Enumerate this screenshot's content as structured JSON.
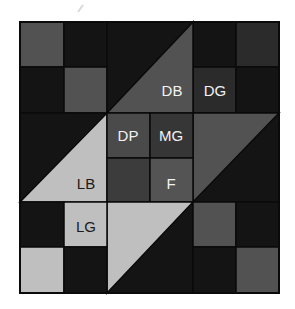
{
  "diagram": {
    "type": "quilt-block",
    "grid": {
      "columns": 6,
      "rows": 6
    },
    "bounds": {
      "x": 20,
      "y": 22,
      "width": 259,
      "height": 271
    },
    "col_edges": [
      20,
      64,
      107,
      150,
      193,
      236,
      279
    ],
    "row_edges": [
      22,
      67,
      113,
      158,
      202,
      247,
      293
    ],
    "colors": {
      "black": "#141414",
      "dark_gray": "#2b2b2b",
      "mid_gray": "#525252",
      "dark_print": "#4a4a4a",
      "medium_gray": "#363636",
      "center_dark": "#3c3c3c",
      "fabric_f": "#545454",
      "light_gray": "#bfbfbf",
      "line": "#0a0a0a",
      "label_light": "#f2f2f2",
      "label_dark": "#1a1a1a"
    },
    "labels": {
      "db": "DB",
      "dg": "DG",
      "dp": "DP",
      "mg": "MG",
      "lb": "LB",
      "f": "F",
      "lg": "LG"
    },
    "legend_meaning": {
      "DB": "dark background",
      "DG": "dark gray",
      "DP": "dark print",
      "MG": "medium gray",
      "LB": "light background",
      "F": "fabric",
      "LG": "light gray"
    }
  }
}
